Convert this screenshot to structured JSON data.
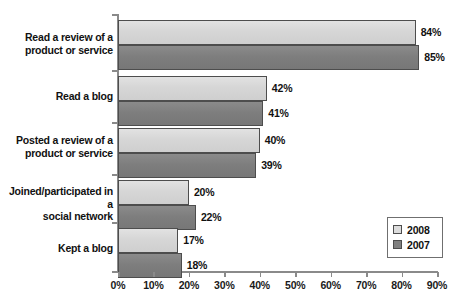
{
  "chart_data": {
    "type": "bar",
    "orientation": "horizontal",
    "title": "",
    "xlabel": "",
    "ylabel": "",
    "xlim": [
      0,
      90
    ],
    "xtick_labels": [
      "0%",
      "10%",
      "20%",
      "30%",
      "40%",
      "50%",
      "60%",
      "70%",
      "80%",
      "90%"
    ],
    "xtick_values": [
      0,
      10,
      20,
      30,
      40,
      50,
      60,
      70,
      80,
      90
    ],
    "grid": false,
    "legend_position": "bottom-right",
    "categories": [
      "Read a review of a product or service",
      "Read a blog",
      "Posted a review of a product or service",
      "Joined/participated in a social network",
      "Kept a blog"
    ],
    "category_lines": [
      [
        "Read a review of a",
        "product or service"
      ],
      [
        "Read a blog"
      ],
      [
        "Posted a review of a",
        "product or service"
      ],
      [
        "Joined/participated in a",
        "social network"
      ],
      [
        "Kept a blog"
      ]
    ],
    "series": [
      {
        "name": "2008",
        "color": "#d9d9d9",
        "values": [
          84,
          42,
          40,
          20,
          17
        ],
        "value_labels": [
          "84%",
          "42%",
          "40%",
          "20%",
          "17%"
        ]
      },
      {
        "name": "2007",
        "color": "#808080",
        "values": [
          85,
          41,
          39,
          22,
          18
        ],
        "value_labels": [
          "85%",
          "41%",
          "39%",
          "22%",
          "18%"
        ]
      }
    ]
  },
  "legend": {
    "entries": [
      {
        "label": "2008",
        "color": "#d9d9d9"
      },
      {
        "label": "2007",
        "color": "#808080"
      }
    ]
  }
}
